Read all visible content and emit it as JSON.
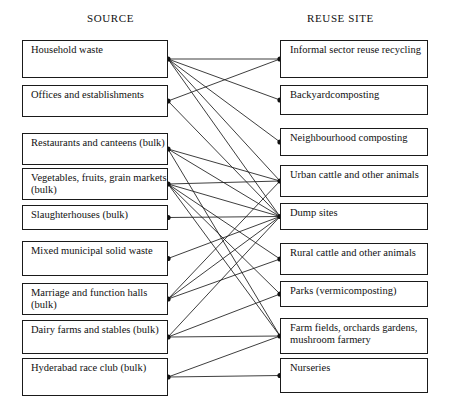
{
  "figure": {
    "headers": {
      "source": "SOURCE",
      "reuse": "REUSE SITE"
    }
  },
  "chart_data": {
    "type": "diagram",
    "title": "",
    "subtype": "bipartite-flow",
    "legend_position": "none",
    "grid": false,
    "columns": [
      {
        "name": "SOURCE",
        "side": "left"
      },
      {
        "name": "REUSE SITE",
        "side": "right"
      }
    ],
    "sources": [
      {
        "id": "s1",
        "label": "Household waste"
      },
      {
        "id": "s2",
        "label": "Offices and  establishments"
      },
      {
        "id": "s3",
        "label": "Restaurants and canteens (bulk)"
      },
      {
        "id": "s4",
        "label": "Vegetables, fruits, grain markets (bulk)"
      },
      {
        "id": "s5",
        "label": "Slaughterhouses (bulk)"
      },
      {
        "id": "s6",
        "label": "Mixed municipal solid waste"
      },
      {
        "id": "s7",
        "label": "Marriage and function halls (bulk)"
      },
      {
        "id": "s8",
        "label": "Dairy farms and stables (bulk)"
      },
      {
        "id": "s9",
        "label": "Hyderabad race club (bulk)"
      }
    ],
    "reuse_sites": [
      {
        "id": "r1",
        "label": "Informal sector reuse recycling"
      },
      {
        "id": "r2",
        "label": "Backyardcomposting"
      },
      {
        "id": "r3",
        "label": "Neighbourhood composting"
      },
      {
        "id": "r4",
        "label": "Urban cattle and other animals"
      },
      {
        "id": "r5",
        "label": "Dump sites"
      },
      {
        "id": "r6",
        "label": "Rural cattle and other animals"
      },
      {
        "id": "r7",
        "label": "Parks (vermicomposting)"
      },
      {
        "id": "r8",
        "label": "Farm fields, orchards gardens, mushroom farmery"
      },
      {
        "id": "r9",
        "label": "Nurseries"
      }
    ],
    "links": [
      {
        "from": "s1",
        "to": "r1"
      },
      {
        "from": "s1",
        "to": "r2"
      },
      {
        "from": "s1",
        "to": "r3"
      },
      {
        "from": "s1",
        "to": "r4"
      },
      {
        "from": "s1",
        "to": "r5"
      },
      {
        "from": "s2",
        "to": "r1"
      },
      {
        "from": "s2",
        "to": "r5"
      },
      {
        "from": "s3",
        "to": "r4"
      },
      {
        "from": "s3",
        "to": "r5"
      },
      {
        "from": "s3",
        "to": "r8"
      },
      {
        "from": "s4",
        "to": "r4"
      },
      {
        "from": "s4",
        "to": "r5"
      },
      {
        "from": "s4",
        "to": "r6"
      },
      {
        "from": "s4",
        "to": "r7"
      },
      {
        "from": "s4",
        "to": "r8"
      },
      {
        "from": "s5",
        "to": "r5"
      },
      {
        "from": "s6",
        "to": "r5"
      },
      {
        "from": "s7",
        "to": "r4"
      },
      {
        "from": "s7",
        "to": "r5"
      },
      {
        "from": "s7",
        "to": "r6"
      },
      {
        "from": "s8",
        "to": "r5"
      },
      {
        "from": "s8",
        "to": "r7"
      },
      {
        "from": "s8",
        "to": "r8"
      },
      {
        "from": "s9",
        "to": "r8"
      },
      {
        "from": "s9",
        "to": "r9"
      }
    ],
    "hubs": [
      {
        "id": "r5",
        "label": "Dump sites",
        "incoming": 7
      }
    ],
    "colors": {
      "box_border": "#1a1a1a",
      "edge": "#1b1b1b",
      "text": "#111111",
      "background": "#ffffff"
    }
  },
  "geometry": {
    "source_box": {
      "x": 22,
      "w": 146
    },
    "reuse_box": {
      "x": 280,
      "w": 148
    },
    "source_tops": [
      40,
      85,
      133,
      168,
      205,
      241,
      283,
      320,
      358
    ],
    "source_heights": [
      38,
      32,
      32,
      32,
      25,
      35,
      32,
      34,
      38
    ],
    "reuse_tops": [
      40,
      85,
      128,
      165,
      203,
      243,
      281,
      318,
      358
    ],
    "reuse_heights": [
      38,
      30,
      28,
      32,
      27,
      32,
      26,
      36,
      35
    ]
  }
}
